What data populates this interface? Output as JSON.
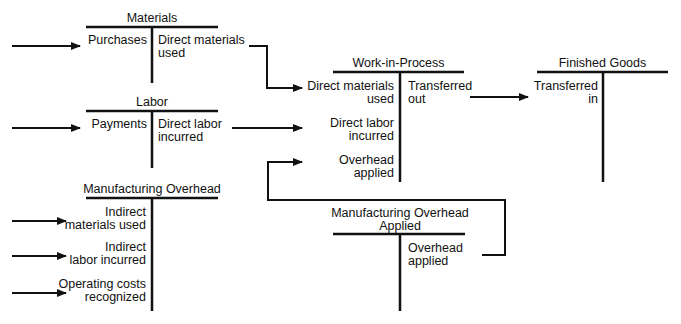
{
  "accounts": {
    "materials": {
      "title": "Materials",
      "debit": [
        "Purchases"
      ],
      "credit": [
        "Direct materials",
        "used"
      ]
    },
    "labor": {
      "title": "Labor",
      "debit": [
        "Payments"
      ],
      "credit": [
        "Direct labor",
        "incurred"
      ]
    },
    "manufacturing_overhead": {
      "title": "Manufacturing Overhead",
      "debit": [
        [
          "Indirect",
          "materials used"
        ],
        [
          "Indirect",
          "labor incurred"
        ],
        [
          "Operating costs",
          "recognized"
        ]
      ]
    },
    "work_in_process": {
      "title": "Work-in-Process",
      "debit": [
        [
          "Direct materials",
          "used"
        ],
        [
          "Direct labor",
          "incurred"
        ],
        [
          "Overhead",
          "applied"
        ]
      ],
      "credit": [
        "Transferred",
        "out"
      ]
    },
    "finished_goods": {
      "title": "Finished Goods",
      "debit": [
        "Transferred",
        "in"
      ]
    },
    "manufacturing_overhead_applied": {
      "title": [
        "Manufacturing Overhead",
        "Applied"
      ],
      "credit": [
        "Overhead",
        "applied"
      ]
    }
  },
  "colors": {
    "line": "#111111",
    "background": "#ffffff"
  }
}
